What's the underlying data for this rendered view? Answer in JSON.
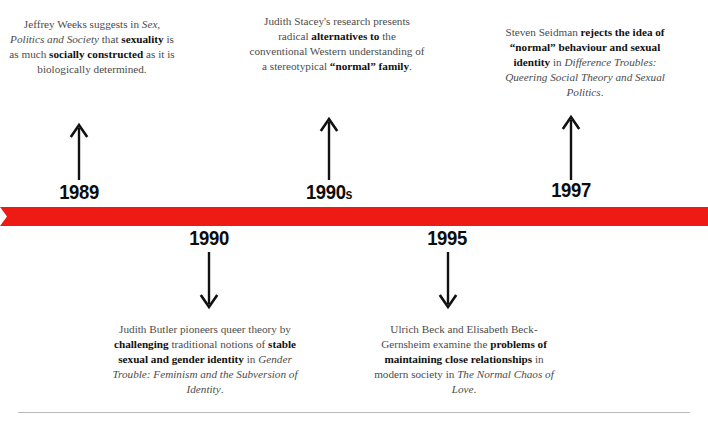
{
  "theme": {
    "bar_color": "#ee1b15",
    "body_text_color": "#4c4c4c",
    "emphasis_text_color": "#111111",
    "rule_color": "#b9b9b9",
    "background": "#ffffff"
  },
  "events_above": [
    {
      "year": "1989",
      "year_suffix": "",
      "arrow": "arrow-up-icon",
      "text": "Jeffrey Weeks suggests in Sex, Politics and Society that sexuality is as much socially constructed as it is biologically determined.",
      "segments": [
        {
          "t": "Jeffrey Weeks suggests in ",
          "style": "normal"
        },
        {
          "t": "Sex, Politics and Society",
          "style": "italic"
        },
        {
          "t": " that ",
          "style": "normal"
        },
        {
          "t": "sexuality",
          "style": "bold"
        },
        {
          "t": " is as much ",
          "style": "normal"
        },
        {
          "t": "socially constructed",
          "style": "bold"
        },
        {
          "t": " as it is biologically determined.",
          "style": "normal"
        }
      ]
    },
    {
      "year": "1990",
      "year_suffix": "s",
      "arrow": "arrow-up-icon",
      "text": "Judith Stacey's research presents radical alternatives to the conventional Western understanding of a stereotypical “normal” family.",
      "segments": [
        {
          "t": "Judith Stacey's research presents radical ",
          "style": "normal"
        },
        {
          "t": "alternatives to",
          "style": "bold"
        },
        {
          "t": " the conventional Western understanding of a stereotypical ",
          "style": "normal"
        },
        {
          "t": "“normal” family",
          "style": "bold"
        },
        {
          "t": ".",
          "style": "normal"
        }
      ]
    },
    {
      "year": "1997",
      "year_suffix": "",
      "arrow": "arrow-up-icon",
      "text": "Steven Seidman rejects the idea of “normal” behaviour and sexual identity in Difference Troubles: Queering Social Theory and Sexual Politics.",
      "segments": [
        {
          "t": "Steven Seidman ",
          "style": "normal"
        },
        {
          "t": "rejects the idea of “normal” behaviour and sexual identity",
          "style": "bold"
        },
        {
          "t": " in ",
          "style": "normal"
        },
        {
          "t": "Difference Troubles: Queering Social Theory and Sexual Politics",
          "style": "italic"
        },
        {
          "t": ".",
          "style": "normal"
        }
      ]
    }
  ],
  "events_below": [
    {
      "year": "1990",
      "year_suffix": "",
      "arrow": "arrow-down-icon",
      "text": "Judith Butler pioneers queer theory by challenging traditional notions of stable sexual and gender identity in Gender Trouble: Feminism and the Subversion of Identity.",
      "segments": [
        {
          "t": "Judith Butler pioneers queer theory by ",
          "style": "normal"
        },
        {
          "t": "challenging",
          "style": "bold"
        },
        {
          "t": " traditional notions of ",
          "style": "normal"
        },
        {
          "t": "stable sexual and gender identity",
          "style": "bold"
        },
        {
          "t": " in ",
          "style": "normal"
        },
        {
          "t": "Gender Trouble: Feminism and the Subversion of Identity",
          "style": "italic"
        },
        {
          "t": ".",
          "style": "normal"
        }
      ]
    },
    {
      "year": "1995",
      "year_suffix": "",
      "arrow": "arrow-down-icon",
      "text": "Ulrich Beck and Elisabeth Beck-Gernsheim examine the problems of maintaining close relationships in modern society in The Normal Chaos of Love.",
      "segments": [
        {
          "t": "Ulrich Beck and Elisabeth Beck-Gernsheim examine the ",
          "style": "normal"
        },
        {
          "t": "problems of maintaining close relationships",
          "style": "bold"
        },
        {
          "t": " in modern society in ",
          "style": "normal"
        },
        {
          "t": "The Normal Chaos of Love",
          "style": "italic"
        },
        {
          "t": ".",
          "style": "normal"
        }
      ]
    }
  ]
}
